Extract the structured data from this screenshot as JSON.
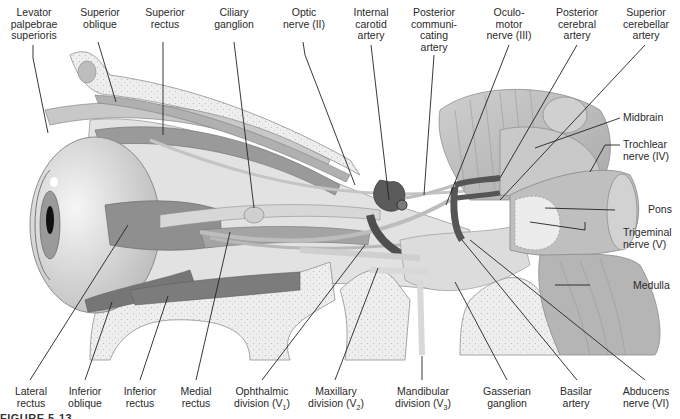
{
  "figure": {
    "caption": "FIGURE 5-13",
    "colors": {
      "background": "#ffffff",
      "tissue_light": "#e6e6e6",
      "tissue_mid": "#bdbdbd",
      "muscle": "#8a8a8a",
      "muscle_dark": "#6e6e6e",
      "bone": "#ededed",
      "artery": "#5a5a5a",
      "leader_line": "#222222"
    }
  },
  "labels_top": [
    {
      "id": "levator",
      "text": "Levator\npalpebrae\nsuperioris"
    },
    {
      "id": "sup-oblique",
      "text": "Superior\noblique"
    },
    {
      "id": "sup-rectus",
      "text": "Superior\nrectus"
    },
    {
      "id": "ciliary",
      "text": "Ciliary\nganglion"
    },
    {
      "id": "optic",
      "text": "Optic\nnerve (II)"
    },
    {
      "id": "int-carotid",
      "text": "Internal\ncarotid\nartery"
    },
    {
      "id": "post-comm",
      "text": "Posterior\ncommuni-\ncating\nartery"
    },
    {
      "id": "oculomotor",
      "text": "Oculo-\nmotor\nnerve (III)"
    },
    {
      "id": "post-cerebral",
      "text": "Posterior\ncerebral\nartery"
    },
    {
      "id": "sup-cerebellar",
      "text": "Superior\ncerebellar\nartery"
    }
  ],
  "labels_right": [
    {
      "id": "midbrain",
      "text": "Midbrain"
    },
    {
      "id": "trochlear",
      "text": "Trochlear\nnerve (IV)"
    },
    {
      "id": "pons",
      "text": "Pons"
    },
    {
      "id": "trigeminal",
      "text": "Trigeminal\nnerve (V)"
    },
    {
      "id": "medulla",
      "text": "Medulla"
    }
  ],
  "labels_bottom": [
    {
      "id": "lat-rectus",
      "text": "Lateral\nrectus"
    },
    {
      "id": "inf-oblique",
      "text": "Inferior\noblique"
    },
    {
      "id": "inf-rectus",
      "text": "Inferior\nrectus"
    },
    {
      "id": "med-rectus",
      "text": "Medial\nrectus"
    },
    {
      "id": "ophthalmic",
      "text": "Ophthalmic\ndivision (V",
      "sub": "1",
      "tail": ")"
    },
    {
      "id": "maxillary",
      "text": "Maxillary\ndivision (V",
      "sub": "2",
      "tail": ")"
    },
    {
      "id": "mandibular",
      "text": "Mandibular\ndivision (V",
      "sub": "3",
      "tail": ")"
    },
    {
      "id": "gasserian",
      "text": "Gasserian\nganglion"
    },
    {
      "id": "basilar",
      "text": "Basilar\nartery"
    },
    {
      "id": "abducens",
      "text": "Abducens\nnerve (VI)"
    }
  ]
}
